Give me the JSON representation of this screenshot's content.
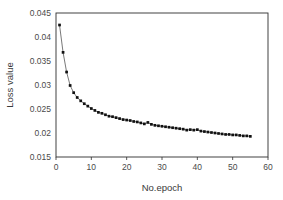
{
  "chart_data": {
    "type": "line",
    "title": "",
    "subtitle": "",
    "xlabel": "No.epoch",
    "ylabel": "Loss value",
    "xlim": [
      0,
      60
    ],
    "ylim": [
      0.015,
      0.045
    ],
    "xticks": [
      0,
      10,
      20,
      30,
      40,
      50,
      60
    ],
    "xtick_labels": [
      "0",
      "10",
      "20",
      "30",
      "40",
      "50",
      "60"
    ],
    "yticks": [
      0.015,
      0.02,
      0.025,
      0.03,
      0.035,
      0.04,
      0.045
    ],
    "ytick_labels": [
      "0.015",
      "0.02",
      "0.025",
      "0.03",
      "0.035",
      "0.04",
      "0.045"
    ],
    "grid": false,
    "legend": false,
    "legend_position": "none",
    "marker": "square",
    "line_color": "#555555",
    "marker_color": "#111111",
    "series": [
      {
        "name": "Loss value",
        "x": [
          1,
          2,
          3,
          4,
          5,
          6,
          7,
          8,
          9,
          10,
          11,
          12,
          13,
          14,
          15,
          16,
          17,
          18,
          19,
          20,
          21,
          22,
          23,
          24,
          25,
          26,
          27,
          28,
          29,
          30,
          31,
          32,
          33,
          34,
          35,
          36,
          37,
          38,
          39,
          40,
          41,
          42,
          43,
          44,
          45,
          46,
          47,
          48,
          49,
          50,
          51,
          52,
          53,
          54,
          55
        ],
        "values": [
          0.0425,
          0.0368,
          0.0327,
          0.0299,
          0.0284,
          0.0274,
          0.0267,
          0.0261,
          0.0256,
          0.0251,
          0.0247,
          0.0243,
          0.0241,
          0.0238,
          0.0235,
          0.0234,
          0.0232,
          0.023,
          0.0228,
          0.0227,
          0.0226,
          0.0224,
          0.0223,
          0.0221,
          0.0219,
          0.0222,
          0.0218,
          0.0216,
          0.0215,
          0.0214,
          0.0213,
          0.0212,
          0.0211,
          0.021,
          0.0209,
          0.0208,
          0.0206,
          0.0207,
          0.0206,
          0.0207,
          0.0204,
          0.0203,
          0.0202,
          0.0201,
          0.02,
          0.0199,
          0.0198,
          0.0197,
          0.0197,
          0.0196,
          0.0196,
          0.0195,
          0.0194,
          0.0194,
          0.0193
        ]
      }
    ]
  },
  "axes": {
    "x_title": "No.epoch",
    "y_title": "Loss value"
  }
}
